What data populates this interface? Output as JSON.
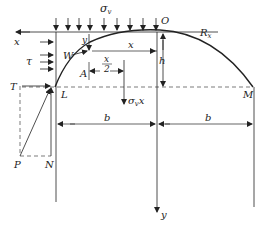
{
  "figure": {
    "labels": {
      "sigma_v": "σ",
      "sigma_v_sub": "v",
      "O": "O",
      "Rx": "R",
      "Rx_sub": "x",
      "x_axis": "x",
      "y_small": "y",
      "W": "W",
      "x_len": "x",
      "x_half_num": "x",
      "x_half_den": "2",
      "A": "A",
      "h": "h",
      "tau": "τ",
      "T": "T",
      "L": "L",
      "M": "M",
      "load_resultant": "σ",
      "load_resultant_sub": "v",
      "load_resultant_x": "x",
      "b_left": "b",
      "b_right": "b",
      "P": "P",
      "N": "N",
      "y_axis": "y"
    },
    "colors": {
      "line": "#222222",
      "dashed": "#444444"
    }
  }
}
